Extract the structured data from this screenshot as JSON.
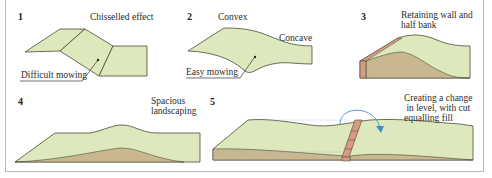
{
  "colors": {
    "grass": "#dde9bd",
    "soil": "#c9b88f",
    "brick": "#d79b82",
    "outline": "#4a4a3a",
    "arrow": "#3d8fd6",
    "frame": "#b9b9b9"
  },
  "panels": [
    {
      "number": "1",
      "labels": {
        "title": "Chisselled effect",
        "pointer": "Difficult mowing"
      }
    },
    {
      "number": "2",
      "labels": {
        "top": "Convex",
        "right": "Concave",
        "pointer": "Easy mowing"
      }
    },
    {
      "number": "3",
      "labels": {
        "title": "Retaining wall and\nhalf bank"
      }
    },
    {
      "number": "4",
      "labels": {
        "title": "Spacious\nlandscaping"
      }
    },
    {
      "number": "5",
      "labels": {
        "title": "Creating a change\n in level, with cut\nequalling fill"
      }
    }
  ]
}
